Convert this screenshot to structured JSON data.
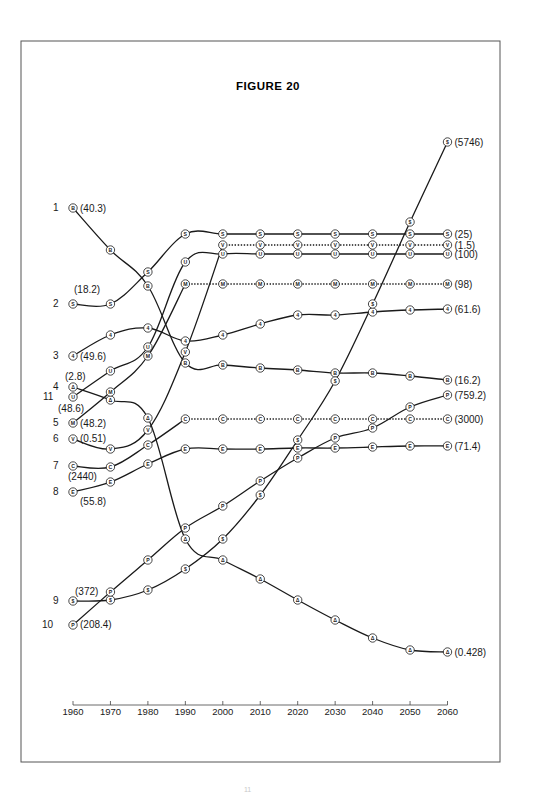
{
  "figure": {
    "title": "FIGURE 20",
    "page_number": "11"
  },
  "chart_data": {
    "type": "line",
    "title": "FIGURE 20",
    "xlabel": "",
    "ylabel": "",
    "x": [
      1960,
      1970,
      1980,
      1990,
      2000,
      2010,
      2020,
      2030,
      2040,
      2050,
      2060
    ],
    "x_tick_labels": [
      "1960",
      "1970",
      "1980",
      "1990",
      "2000",
      "2010",
      "2020",
      "2030",
      "2040",
      "2050",
      "2060"
    ],
    "grid": false,
    "legend_position": "inline labels at line ends",
    "note": "Unlabeled y-axis: lines show relative rank/position over time; parenthesized numbers are start (1960) and end (2060) values",
    "series": [
      {
        "id": 1,
        "symbol": "B",
        "marker": "Ⓑ",
        "start_value": "40.3",
        "end_value": "16.2",
        "start_label": "(40.3)",
        "end_label": "(16.2)",
        "style": "solid",
        "y_px": [
          208,
          250,
          286,
          363,
          365,
          368,
          370,
          373,
          373,
          376,
          380
        ]
      },
      {
        "id": 2,
        "symbol": "S",
        "marker": "Ⓢ",
        "start_value": "18.2",
        "end_value": "25",
        "start_label": "(18.2)",
        "end_label": "(25)",
        "style": "solid",
        "y_px": [
          304,
          304,
          272,
          234,
          234,
          234,
          234,
          234,
          234,
          234,
          234
        ]
      },
      {
        "id": 3,
        "symbol": "4",
        "marker": "④",
        "start_value": "49.6",
        "end_value": "61.6",
        "start_label": "(49.6)",
        "end_label": "(61.6)",
        "style": "solid",
        "y_px": [
          356,
          335,
          328,
          341,
          335,
          324,
          315,
          315,
          312,
          310,
          309
        ]
      },
      {
        "id": 4,
        "symbol": "Δ",
        "marker": "Ⓐ",
        "start_value": "2.8",
        "end_value": "0.428",
        "start_label": "(2.8)",
        "end_label": "(0.428)",
        "style": "solid",
        "y_px": [
          387,
          400,
          418,
          539,
          560,
          579,
          600,
          620,
          638,
          650,
          652
        ]
      },
      {
        "id": 5,
        "symbol": "M",
        "marker": "Ⓜ",
        "start_value": "48.2",
        "end_value": "98",
        "start_label": "(48.2)",
        "end_label": "(98)",
        "style": "dotted-after-1990",
        "y_px": [
          423,
          392,
          356,
          284,
          284,
          284,
          284,
          284,
          284,
          284,
          284
        ]
      },
      {
        "id": 6,
        "symbol": "V",
        "marker": "Ⓥ",
        "start_value": "0.51",
        "end_value": "1.5",
        "start_label": "(0.51)",
        "end_label": "(1.5)",
        "style": "dotted-after-2000",
        "y_px": [
          439,
          449,
          430,
          352,
          245,
          245,
          245,
          245,
          245,
          245,
          245
        ]
      },
      {
        "id": 7,
        "symbol": "C",
        "marker": "Ⓒ",
        "start_value": "2440",
        "end_value": "3000",
        "start_label": "(2440)",
        "end_label": "(3000)",
        "style": "dotted-after-1990",
        "y_px": [
          466,
          467,
          445,
          419,
          419,
          419,
          419,
          419,
          419,
          419,
          419
        ]
      },
      {
        "id": 8,
        "symbol": "E",
        "marker": "Ⓔ",
        "start_value": "55.8",
        "end_value": "71.4",
        "start_label": "(55.8)",
        "end_label": "(71.4)",
        "style": "solid",
        "y_px": [
          492,
          482,
          464,
          449,
          449,
          449,
          448,
          448,
          447,
          446,
          446
        ]
      },
      {
        "id": 9,
        "symbol": "$",
        "marker": "$",
        "start_value": "372",
        "end_value": "5746",
        "start_label": "(372)",
        "end_label": "(5746)",
        "style": "solid",
        "y_px": [
          601,
          600,
          590,
          569,
          539,
          495,
          440,
          381,
          304,
          222,
          142
        ]
      },
      {
        "id": 10,
        "symbol": "P",
        "marker": "Ⓟ",
        "start_value": "208.4",
        "end_value": "759.2",
        "start_label": "(208.4)",
        "end_label": "(759.2)",
        "style": "solid",
        "y_px": [
          625,
          592,
          560,
          528,
          506,
          481,
          458,
          438,
          428,
          407,
          395
        ]
      },
      {
        "id": 11,
        "symbol": "U",
        "marker": "Ⓤ",
        "start_value": "48.6",
        "end_value": "100",
        "start_label": "(48.6)",
        "end_label": "(100)",
        "style": "solid",
        "y_px": [
          397,
          371,
          347,
          262,
          254,
          254,
          254,
          254,
          254,
          254,
          254
        ]
      }
    ]
  },
  "left_labels": [
    {
      "num": "1",
      "sym": "B",
      "value": "(40.3)"
    },
    {
      "num": "2",
      "sym": "S",
      "value": "(18.2)"
    },
    {
      "num": "3",
      "sym": "4",
      "value": "(49.6)"
    },
    {
      "num": "4",
      "sym": "Δ",
      "value": "(2.8)"
    },
    {
      "num": "11",
      "sym": "U",
      "value": "(48.6)"
    },
    {
      "num": "5",
      "sym": "M",
      "value": "(48.2)"
    },
    {
      "num": "6",
      "sym": "V",
      "value": "(0.51)"
    },
    {
      "num": "7",
      "sym": "C",
      "value": "(2440)"
    },
    {
      "num": "8",
      "sym": "E",
      "value": "(55.8)"
    },
    {
      "num": "9",
      "sym": "$",
      "value": "(372)"
    },
    {
      "num": "10",
      "sym": "P",
      "value": "(208.4)"
    }
  ],
  "colors": {
    "ink": "#1a1a1a",
    "border": "#555555",
    "background": "#ffffff"
  }
}
